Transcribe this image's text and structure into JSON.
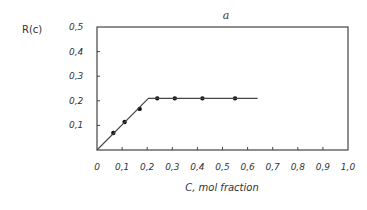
{
  "chart_data": {
    "type": "line",
    "title": "a",
    "xlabel": "C, mol fraction",
    "ylabel": "R(c)",
    "xlim": [
      0,
      1.0
    ],
    "ylim": [
      0,
      0.5
    ],
    "x_ticks": [
      "0",
      "0,1",
      "0,2",
      "0,3",
      "0,4",
      "0,5",
      "0,6",
      "0,7",
      "0,8",
      "0,9",
      "1,0"
    ],
    "y_ticks": [
      "0,1",
      "0,2",
      "0,3",
      "0,4",
      "0,5"
    ],
    "grid": false,
    "legend": null,
    "series": [
      {
        "name": "measured points",
        "marker": "dot",
        "x": [
          0.065,
          0.11,
          0.17,
          0.24,
          0.31,
          0.42,
          0.55
        ],
        "y": [
          0.069,
          0.114,
          0.167,
          0.21,
          0.21,
          0.21,
          0.21
        ]
      },
      {
        "name": "fit line",
        "marker": "none",
        "x": [
          0,
          0.205,
          0.64
        ],
        "y": [
          0,
          0.21,
          0.21
        ]
      }
    ]
  }
}
